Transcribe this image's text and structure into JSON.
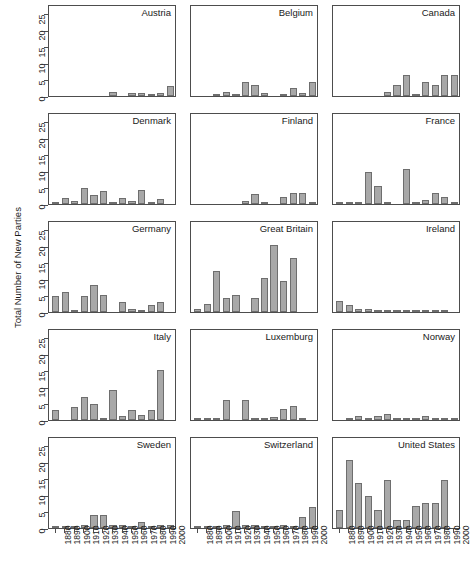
{
  "chart_data": {
    "type": "bar",
    "title": "",
    "xlabel": "",
    "ylabel": "Total Number of New Parties",
    "ylim": [
      0,
      27
    ],
    "yticks": [
      0,
      5,
      10,
      15,
      20,
      25
    ],
    "ytick_labels": [
      "0",
      "5",
      "10",
      "15",
      "20",
      "25"
    ],
    "grid": false,
    "legend": "none",
    "layout": {
      "rows": 5,
      "cols": 3
    },
    "categories": [
      "1880",
      "1890",
      "1900",
      "1910",
      "1920",
      "1930",
      "1940",
      "1950",
      "1960",
      "1970",
      "1980",
      "1990"
    ],
    "xtick_labels": [
      "1880",
      "1890",
      "1900",
      "1910",
      "1920",
      "1930",
      "1940",
      "1950",
      "1960",
      "1970",
      "1980",
      "1990",
      "2000"
    ],
    "bar_color": "#a8a8a8",
    "bar_edge_color": "#6e6e6e",
    "panels": [
      {
        "name": "Austria",
        "values": [
          0,
          0,
          0,
          0,
          0,
          0,
          1.3,
          0,
          0.8,
          0.8,
          0.3,
          0.8,
          3.0
        ]
      },
      {
        "name": "Belgium",
        "values": [
          0,
          0,
          0.3,
          1.2,
          0.3,
          4.3,
          3.3,
          1.0,
          0,
          0.3,
          2.3,
          0.9,
          4.3,
          3.3
        ]
      },
      {
        "name": "Canada",
        "values": [
          0,
          0,
          0,
          0,
          0,
          1.1,
          3.3,
          6.5,
          0.3,
          4.4,
          3.3,
          6.3,
          6.5
        ]
      },
      {
        "name": "Denmark",
        "values": [
          0.7,
          1.7,
          0.8,
          5.0,
          2.8,
          4.0,
          0.2,
          1.9,
          0.9,
          4.2,
          0.2,
          1.5
        ]
      },
      {
        "name": "Finland",
        "values": [
          0,
          0,
          0,
          0,
          0,
          0.9,
          3.0,
          0.3,
          0,
          2.0,
          3.2,
          3.2,
          0.3
        ]
      },
      {
        "name": "France",
        "values": [
          0.2,
          0.2,
          0.2,
          9.7,
          5.4,
          0.3,
          0,
          10.6,
          0.7,
          1.3,
          3.2,
          2.0,
          0.2
        ]
      },
      {
        "name": "Germany",
        "values": [
          4.8,
          6.1,
          0.2,
          5.0,
          8.2,
          5.2,
          0,
          3.1,
          1.0,
          0.2,
          2.0,
          3.0
        ]
      },
      {
        "name": "Great Britain",
        "values": [
          0.8,
          2.3,
          12.3,
          4.4,
          5.3,
          0,
          4.3,
          10.4,
          20.3,
          9.5,
          16.5
        ]
      },
      {
        "name": "Ireland",
        "values": [
          3.2,
          2.0,
          1.0,
          1.0,
          0.2,
          0.2,
          0.2,
          0.2,
          0.2,
          0.2,
          0.2,
          0.2
        ]
      },
      {
        "name": "Italy",
        "values": [
          2.9,
          0,
          3.8,
          6.9,
          5.0,
          0.2,
          9.2,
          1.1,
          3.0,
          1.6,
          3.0,
          15.2
        ]
      },
      {
        "name": "Luxemburg",
        "values": [
          0.2,
          0.2,
          0.2,
          6.1,
          0,
          6.2,
          0.3,
          0.3,
          1.0,
          3.2,
          4.3,
          0.3
        ]
      },
      {
        "name": "Norway",
        "values": [
          0,
          0.2,
          1.1,
          0.7,
          1.3,
          1.9,
          0.7,
          0.2,
          0.7,
          1.2,
          0.7,
          0.7,
          0.7
        ]
      },
      {
        "name": "Sweden",
        "values": [
          0.1,
          0.2,
          0.2,
          0.8,
          3.8,
          3.8,
          0.8,
          0.8,
          0.2,
          1.9,
          0.2,
          0.8,
          0.8
        ]
      },
      {
        "name": "Switzerland",
        "values": [
          0.7,
          0.2,
          0.2,
          0.9,
          5.2,
          0.9,
          0.9,
          0.7,
          0.2,
          0.8,
          0.2,
          3.4,
          6.4,
          0.9
        ]
      },
      {
        "name": "United States",
        "values": [
          5.5,
          20.5,
          13.6,
          9.6,
          5.6,
          14.7,
          2.4,
          2.5,
          6.6,
          7.6,
          7.6,
          14.7
        ]
      }
    ]
  }
}
